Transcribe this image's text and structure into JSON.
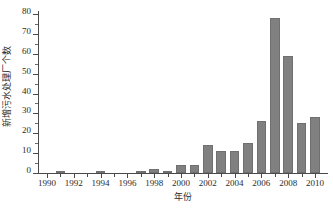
{
  "chart_data": {
    "type": "bar",
    "title": "",
    "xlabel": "年份",
    "ylabel": "新增污水处理厂个数",
    "categories": [
      1990,
      1991,
      1992,
      1993,
      1994,
      1995,
      1996,
      1997,
      1998,
      1999,
      2000,
      2001,
      2002,
      2003,
      2004,
      2005,
      2006,
      2007,
      2008,
      2009,
      2010
    ],
    "values": [
      0,
      1,
      0,
      0,
      1,
      0,
      0,
      1,
      2,
      1,
      4,
      4,
      14,
      11,
      11,
      15,
      26,
      78,
      59,
      25,
      28
    ],
    "ylim": [
      0,
      85
    ],
    "xlim": [
      1989.4,
      2010.9
    ],
    "ytick_labels": [
      "0",
      "10",
      "20",
      "30",
      "40",
      "50",
      "60",
      "70",
      "80"
    ],
    "ytick_values": [
      0,
      10,
      20,
      30,
      40,
      50,
      60,
      70,
      80
    ],
    "xtick_labels": [
      "1990",
      "1992",
      "1994",
      "1996",
      "1998",
      "2000",
      "2002",
      "2004",
      "2006",
      "2008",
      "2010"
    ],
    "xtick_values": [
      1990,
      1992,
      1994,
      1996,
      1998,
      2000,
      2002,
      2004,
      2006,
      2008,
      2010
    ],
    "grid": false,
    "legend": null,
    "bar_color": "#808080",
    "axis_color": "#4a4a4a",
    "text_color": "#2b2b2b"
  }
}
